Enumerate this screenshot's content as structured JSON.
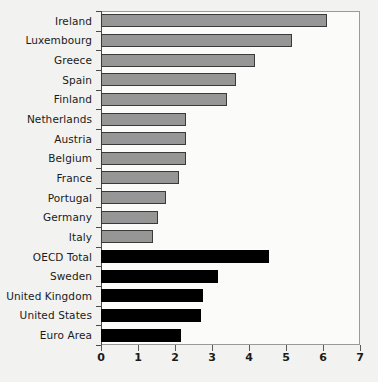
{
  "chart_data": {
    "type": "bar",
    "orientation": "horizontal",
    "title": "",
    "xlabel": "",
    "ylabel": "",
    "xlim": [
      0,
      7
    ],
    "xticks": [
      0,
      1,
      2,
      3,
      4,
      5,
      6,
      7
    ],
    "xtick_labels": [
      "0",
      "1",
      "2",
      "3",
      "4",
      "5",
      "6",
      "7"
    ],
    "grid": false,
    "legend": "none",
    "categories": [
      "Ireland",
      "Luxembourg",
      "Greece",
      "Spain",
      "Finland",
      "Netherlands",
      "Austria",
      "Belgium",
      "France",
      "Portugal",
      "Germany",
      "Italy",
      "OECD Total",
      "Sweden",
      "United Kingdom",
      "United States",
      "Euro Area"
    ],
    "values": [
      6.1,
      5.15,
      4.15,
      3.65,
      3.4,
      2.3,
      2.3,
      2.3,
      2.1,
      1.75,
      1.55,
      1.4,
      4.55,
      3.15,
      2.75,
      2.7,
      2.15
    ],
    "bar_colors": [
      "#969696",
      "#969696",
      "#969696",
      "#969696",
      "#969696",
      "#969696",
      "#969696",
      "#969696",
      "#969696",
      "#969696",
      "#969696",
      "#969696",
      "#000000",
      "#000000",
      "#000000",
      "#000000",
      "#000000"
    ],
    "bar_styles": [
      "grey",
      "grey",
      "grey",
      "grey",
      "grey",
      "grey",
      "grey",
      "grey",
      "grey",
      "grey",
      "grey",
      "grey",
      "black",
      "black",
      "black",
      "black",
      "black"
    ]
  },
  "colors": {
    "background": "#f2f2f0",
    "plot_background": "#fbfbfa",
    "axis": "#4a4a4a",
    "frame": "#9a9a9a",
    "bar_grey": "#969696",
    "bar_black": "#000000",
    "text": "#1a1a1a"
  }
}
